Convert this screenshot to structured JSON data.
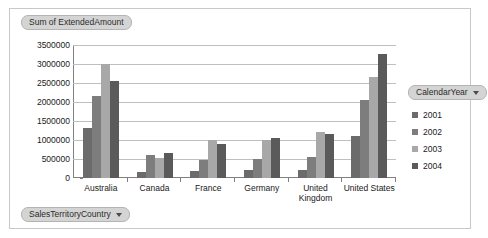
{
  "chart_data": {
    "type": "bar",
    "title": "Sum of ExtendedAmount",
    "xlabel": "SalesTerritoryCountry",
    "ylabel": "",
    "ylim": [
      0,
      3500000
    ],
    "ytick_labels": [
      "3500000",
      "3000000",
      "2500000",
      "2000000",
      "1500000",
      "1000000",
      "500000",
      "0"
    ],
    "ytick_values": [
      3500000,
      3000000,
      2500000,
      2000000,
      1500000,
      1000000,
      500000,
      0
    ],
    "grid": true,
    "legend_position": "right",
    "legend_title": "CalendarYear",
    "categories": [
      "Australia",
      "Canada",
      "France",
      "Germany",
      "United Kingdom",
      "United States"
    ],
    "series": [
      {
        "name": "2001",
        "color": "#6b6b6b",
        "values": [
          1310000,
          150000,
          180000,
          200000,
          220000,
          1100000
        ]
      },
      {
        "name": "2002",
        "color": "#7d7d7d",
        "values": [
          2150000,
          600000,
          480000,
          490000,
          540000,
          2050000
        ]
      },
      {
        "name": "2003",
        "color": "#a8a8a8",
        "values": [
          3000000,
          520000,
          1000000,
          1010000,
          1220000,
          2650000
        ]
      },
      {
        "name": "2004",
        "color": "#5a5a5a",
        "values": [
          2550000,
          670000,
          900000,
          1040000,
          1160000,
          3270000
        ]
      }
    ]
  },
  "pivot_chart": {
    "value_field_label": "Sum of ExtendedAmount",
    "category_field_label": "SalesTerritoryCountry",
    "legend_field_label": "CalendarYear"
  }
}
